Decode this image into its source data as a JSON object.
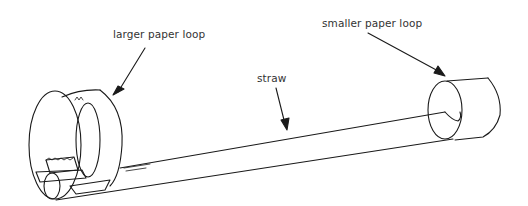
{
  "diagram": {
    "labels": {
      "larger_loop": "larger paper loop",
      "straw": "straw",
      "smaller_loop": "smaller paper loop"
    },
    "colors": {
      "stroke": "#1a1a1a",
      "text": "#333333",
      "background": "#ffffff"
    }
  }
}
